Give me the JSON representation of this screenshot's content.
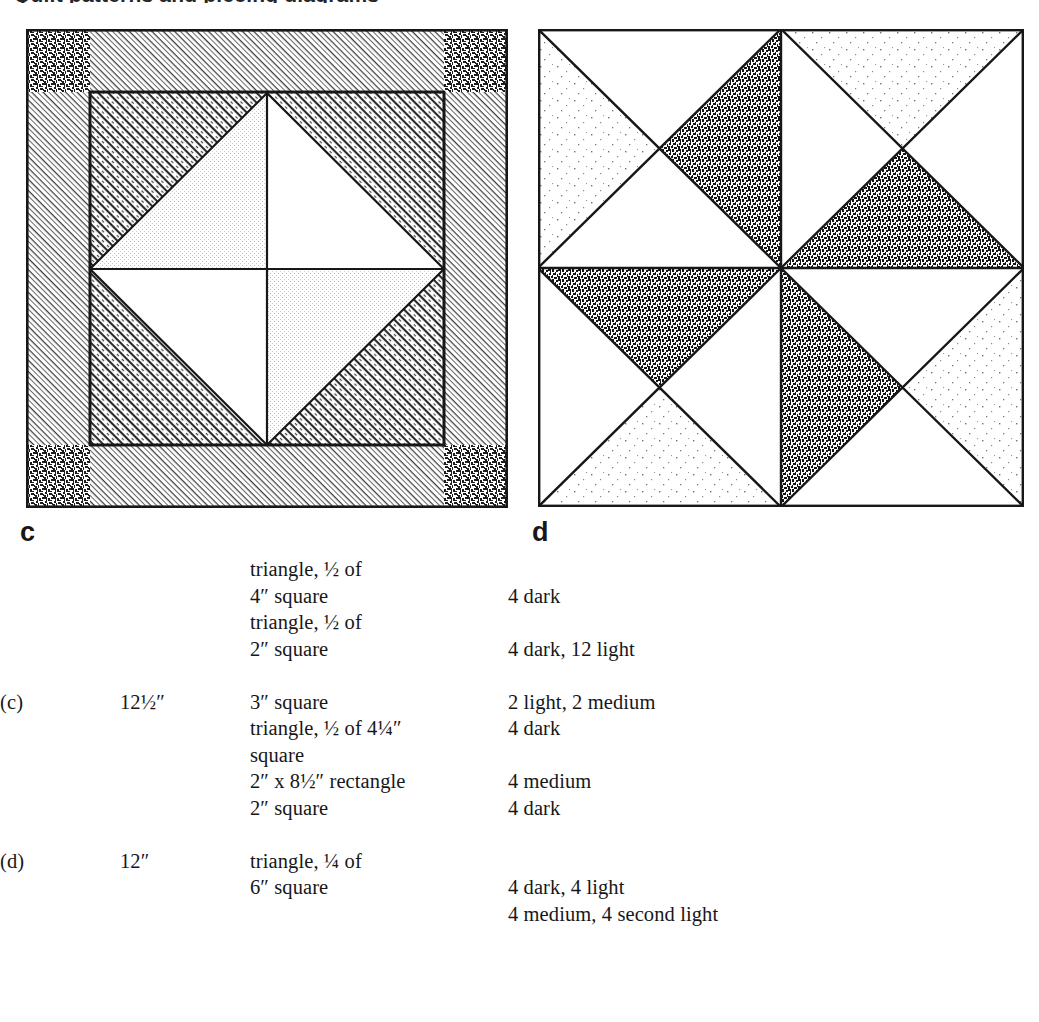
{
  "page": {
    "background": "#ffffff",
    "ink": "#17171a",
    "heading_sliver": "Quilt patterns and piecing diagrams"
  },
  "figures": [
    {
      "id": "c",
      "letter": "c",
      "name": "block-diagram-c",
      "description": "Square-in-a-square quilt block with pieced border, corner squares and a four-patch center set on point",
      "fabrics": {
        "dark": "#3a3a3a",
        "medium": "#8f8f8f",
        "light": "#d8d8d8",
        "second_light": "#efefef",
        "white": "#ffffff",
        "line": "#17171a"
      }
    },
    {
      "id": "d",
      "letter": "d",
      "name": "block-diagram-d",
      "description": "Four quarter-square-triangle units arranged as a pinwheel",
      "fabrics": {
        "dark": "#3f3f3f",
        "medium": "#8f8f8f",
        "second_light": "#f0f0f0",
        "white": "#ffffff",
        "line": "#17171a"
      }
    }
  ],
  "table": {
    "columns": [
      "block",
      "finished_size",
      "piece",
      "fabric_count"
    ],
    "rows": [
      {
        "block": "",
        "finished_size": "",
        "piece": [
          "triangle, ½ of",
          "4″ square"
        ],
        "fabric_count": [
          "",
          "4 dark"
        ]
      },
      {
        "block": "",
        "finished_size": "",
        "piece": [
          "triangle, ½ of",
          "2″ square"
        ],
        "fabric_count": [
          "",
          "4 dark, 12 light"
        ]
      },
      {
        "block": "(c)",
        "finished_size": "12½″",
        "piece": [
          "3″ square",
          "triangle, ½ of 4¼″",
          "square",
          "2″ x 8½″ rectangle",
          "2″ square"
        ],
        "fabric_count": [
          "2 light, 2 medium",
          "4 dark",
          "",
          "4 medium",
          "4 dark"
        ]
      },
      {
        "block": "(d)",
        "finished_size": "12″",
        "piece": [
          "triangle, ¼ of",
          "6″ square"
        ],
        "fabric_count": [
          "",
          "4 dark, 4 light",
          "4 medium, 4 second light"
        ]
      }
    ]
  }
}
